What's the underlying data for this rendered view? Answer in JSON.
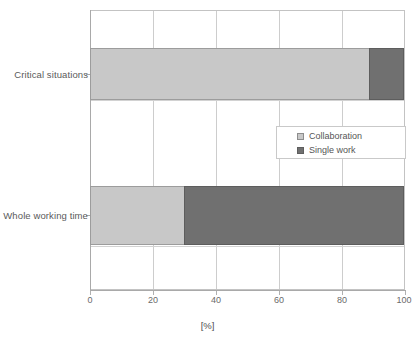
{
  "chart_data": {
    "type": "bar",
    "orientation": "horizontal",
    "stacked": true,
    "title": "",
    "subtitle": "",
    "xlabel": "[%]",
    "ylabel": "",
    "xlim": [
      0,
      100
    ],
    "xticks": [
      0,
      20,
      40,
      60,
      80,
      100
    ],
    "xtick_labels": [
      "0",
      "20",
      "40",
      "60",
      "80",
      "100"
    ],
    "grid": true,
    "grid_axis": "both",
    "legend_position": "center-right",
    "categories": [
      "Critical situations",
      "Whole working time"
    ],
    "series": [
      {
        "name": "Collaboration",
        "color": "#c8c8c8",
        "values": [
          89,
          30
        ]
      },
      {
        "name": "Single work",
        "color": "#707070",
        "values": [
          11,
          70
        ]
      }
    ]
  },
  "legend": {
    "items": [
      {
        "label": "Collaboration",
        "swatch_color": "#c8c8c8"
      },
      {
        "label": "Single work",
        "swatch_color": "#707070"
      }
    ]
  },
  "axis": {
    "x_title": "[%]"
  },
  "colors": {
    "collaboration": "#c8c8c8",
    "single_work": "#707070",
    "grid": "#cdcdcd",
    "axis": "#a9a9a9",
    "text": "#555555",
    "background": "#ffffff"
  }
}
